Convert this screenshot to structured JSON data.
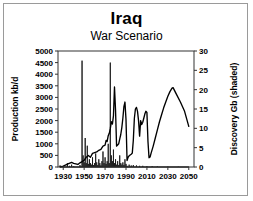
{
  "chart_data": {
    "type": "line",
    "title": "Iraq",
    "subtitle": "War Scenario",
    "xlabel": "",
    "ylabel": "Production kb/d",
    "y2label": "Discovery Gb (shaded)",
    "xlim": [
      1925,
      2055
    ],
    "ylim": [
      0,
      5000
    ],
    "y2lim": [
      0,
      30
    ],
    "xticks": [
      1930,
      1950,
      1970,
      1990,
      2010,
      2030,
      2050
    ],
    "yticks": [
      0,
      500,
      1000,
      1500,
      2000,
      2500,
      3000,
      3500,
      4000,
      4500,
      5000
    ],
    "y2ticks": [
      0,
      5,
      10,
      15,
      20,
      25,
      30
    ],
    "grid": false,
    "legend": "none",
    "series": [
      {
        "name": "Production kb/d",
        "axis": "left",
        "style": "line",
        "color": "#000000",
        "points": [
          [
            1927,
            5
          ],
          [
            1930,
            40
          ],
          [
            1934,
            120
          ],
          [
            1938,
            200
          ],
          [
            1940,
            160
          ],
          [
            1944,
            110
          ],
          [
            1946,
            180
          ],
          [
            1948,
            230
          ],
          [
            1950,
            290
          ],
          [
            1952,
            420
          ],
          [
            1954,
            500
          ],
          [
            1956,
            420
          ],
          [
            1958,
            590
          ],
          [
            1960,
            620
          ],
          [
            1962,
            650
          ],
          [
            1964,
            720
          ],
          [
            1966,
            760
          ],
          [
            1968,
            900
          ],
          [
            1970,
            940
          ],
          [
            1971,
            1150
          ],
          [
            1972,
            1100
          ],
          [
            1973,
            1350
          ],
          [
            1974,
            1450
          ],
          [
            1975,
            1650
          ],
          [
            1976,
            1950
          ],
          [
            1977,
            1850
          ],
          [
            1978,
            2200
          ],
          [
            1979,
            3450
          ],
          [
            1980,
            2450
          ],
          [
            1981,
            900
          ],
          [
            1982,
            950
          ],
          [
            1983,
            1000
          ],
          [
            1984,
            1200
          ],
          [
            1985,
            1400
          ],
          [
            1986,
            1700
          ],
          [
            1987,
            2100
          ],
          [
            1988,
            2600
          ],
          [
            1989,
            2800
          ],
          [
            1990,
            2050
          ],
          [
            1991,
            280
          ],
          [
            1992,
            420
          ],
          [
            1993,
            480
          ],
          [
            1994,
            520
          ],
          [
            1995,
            550
          ],
          [
            1996,
            600
          ],
          [
            1997,
            1150
          ],
          [
            1998,
            2100
          ],
          [
            1999,
            2500
          ],
          [
            2000,
            2570
          ],
          [
            2001,
            2400
          ],
          [
            2002,
            2000
          ],
          [
            2003,
            1330
          ],
          [
            2004,
            2000
          ],
          [
            2005,
            1830
          ],
          [
            2006,
            1930
          ],
          [
            2007,
            2100
          ],
          [
            2008,
            2280
          ],
          [
            2009,
            2400
          ],
          [
            2010,
            2350
          ],
          [
            2011,
            1100
          ],
          [
            2012,
            400
          ],
          [
            2013,
            430
          ],
          [
            2014,
            600
          ],
          [
            2016,
            900
          ],
          [
            2018,
            1250
          ],
          [
            2020,
            1600
          ],
          [
            2022,
            1950
          ],
          [
            2024,
            2250
          ],
          [
            2026,
            2550
          ],
          [
            2028,
            2800
          ],
          [
            2030,
            3050
          ],
          [
            2032,
            3250
          ],
          [
            2034,
            3400
          ],
          [
            2035,
            3420
          ],
          [
            2038,
            3150
          ],
          [
            2042,
            2800
          ],
          [
            2046,
            2400
          ],
          [
            2050,
            1750
          ]
        ]
      },
      {
        "name": "Discovery Gb (shaded)",
        "axis": "right",
        "style": "shaded-spikes",
        "color": "#1a1a1a",
        "points": [
          [
            1927,
            0.4
          ],
          [
            1928,
            0.2
          ],
          [
            1934,
            1.0
          ],
          [
            1936,
            0.3
          ],
          [
            1938,
            0.6
          ],
          [
            1940,
            0.2
          ],
          [
            1946,
            0.5
          ],
          [
            1948,
            27.5
          ],
          [
            1949,
            3.0
          ],
          [
            1950,
            1.2
          ],
          [
            1951,
            7.5
          ],
          [
            1952,
            1.0
          ],
          [
            1953,
            5.5
          ],
          [
            1954,
            0.8
          ],
          [
            1955,
            2.0
          ],
          [
            1956,
            1.0
          ],
          [
            1957,
            0.6
          ],
          [
            1958,
            2.5
          ],
          [
            1959,
            0.5
          ],
          [
            1960,
            1.0
          ],
          [
            1961,
            3.5
          ],
          [
            1962,
            1.2
          ],
          [
            1963,
            0.5
          ],
          [
            1964,
            2.0
          ],
          [
            1965,
            1.0
          ],
          [
            1966,
            0.4
          ],
          [
            1967,
            1.5
          ],
          [
            1968,
            4.0
          ],
          [
            1969,
            1.0
          ],
          [
            1970,
            2.5
          ],
          [
            1971,
            0.8
          ],
          [
            1972,
            1.5
          ],
          [
            1973,
            6.0
          ],
          [
            1974,
            1.0
          ],
          [
            1975,
            27.0
          ],
          [
            1976,
            3.0
          ],
          [
            1977,
            1.5
          ],
          [
            1978,
            4.5
          ],
          [
            1979,
            1.0
          ],
          [
            1980,
            2.0
          ],
          [
            1981,
            0.6
          ],
          [
            1982,
            1.5
          ],
          [
            1983,
            0.5
          ],
          [
            1984,
            3.0
          ],
          [
            1985,
            1.0
          ],
          [
            1986,
            0.6
          ],
          [
            1987,
            1.2
          ],
          [
            1988,
            0.5
          ],
          [
            1989,
            2.0
          ],
          [
            1990,
            0.8
          ],
          [
            1991,
            0.3
          ],
          [
            1993,
            0.6
          ],
          [
            1995,
            0.4
          ],
          [
            1997,
            0.5
          ],
          [
            2000,
            0.4
          ],
          [
            2003,
            0.3
          ],
          [
            2006,
            0.3
          ],
          [
            2010,
            0.2
          ],
          [
            2015,
            0.2
          ],
          [
            2020,
            0.15
          ],
          [
            2030,
            0.1
          ],
          [
            2040,
            0.08
          ],
          [
            2050,
            0.05
          ]
        ]
      }
    ]
  }
}
